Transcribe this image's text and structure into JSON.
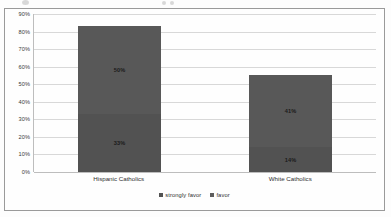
{
  "chart_data": {
    "type": "bar",
    "subtype": "stacked-column",
    "title": "",
    "xlabel": "",
    "ylabel": "",
    "categories": [
      "Hispanic Catholics",
      "White Catholics"
    ],
    "series": [
      {
        "name": "strongly favor",
        "values": [
          33,
          14
        ],
        "labels": [
          "33%",
          "14%"
        ],
        "color": "#525252"
      },
      {
        "name": "favor",
        "values": [
          50,
          41
        ],
        "labels": [
          "50%",
          "41%"
        ],
        "color": "#585858"
      }
    ],
    "totals": [
      83,
      55
    ],
    "ylim": [
      0,
      90
    ],
    "ytick_values": [
      0,
      10,
      20,
      30,
      40,
      50,
      60,
      70,
      80,
      90
    ],
    "ytick_labels": [
      "0%",
      "10%",
      "20%",
      "30%",
      "40%",
      "50%",
      "60%",
      "70%",
      "80%",
      "90%"
    ],
    "grid": true,
    "legend_position": "bottom"
  },
  "axis": {
    "ticks": [
      {
        "label": "90%",
        "value": 90
      },
      {
        "label": "80%",
        "value": 80
      },
      {
        "label": "70%",
        "value": 70
      },
      {
        "label": "60%",
        "value": 60
      },
      {
        "label": "50%",
        "value": 50
      },
      {
        "label": "40%",
        "value": 40
      },
      {
        "label": "30%",
        "value": 30
      },
      {
        "label": "20%",
        "value": 20
      },
      {
        "label": "10%",
        "value": 10
      },
      {
        "label": "0%",
        "value": 0
      }
    ]
  },
  "categories": [
    {
      "label": "Hispanic Catholics",
      "upper_label": "50%",
      "lower_label": "33%",
      "upper_value": 50,
      "lower_value": 33
    },
    {
      "label": "White Catholics",
      "upper_label": "41%",
      "lower_label": "14%",
      "upper_value": 41,
      "lower_value": 14
    }
  ],
  "legend": {
    "items": [
      {
        "label": "strongly favor",
        "color": "#525252"
      },
      {
        "label": "favor",
        "color": "#5d5d5d"
      }
    ]
  },
  "colors": {
    "bar_upper": "#585858",
    "bar_lower": "#525252",
    "gridline": "#d8d8d8",
    "frame": "#9a9a9a",
    "background": "#fefefe"
  }
}
